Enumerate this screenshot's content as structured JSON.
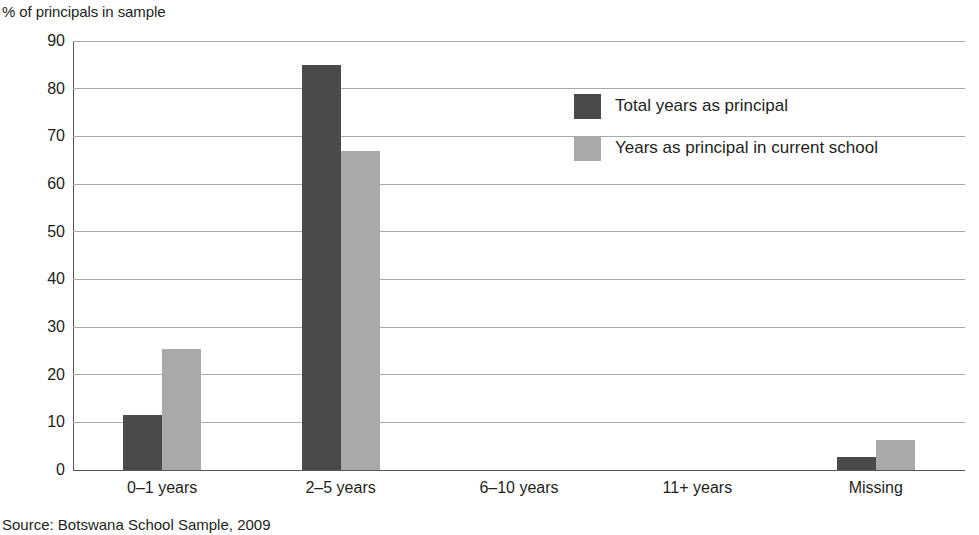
{
  "chart_data": {
    "type": "bar",
    "title": "",
    "subtitle": "% of principals in sample",
    "xlabel": "",
    "ylabel": "% of principals in sample",
    "categories": [
      "0–1 years",
      "2–5 years",
      "6–10 years",
      "11+ years",
      "Missing"
    ],
    "series": [
      {
        "name": "Total years as principal",
        "color": "#4a4a4a",
        "values": [
          11.5,
          85.0,
          0.0,
          0.0,
          2.7
        ]
      },
      {
        "name": "Years as principal in current school",
        "color": "#a9a9a9",
        "values": [
          25.3,
          67.0,
          0.0,
          0.0,
          6.4
        ]
      }
    ],
    "ylim": [
      0,
      90
    ],
    "yticks": [
      0,
      10,
      20,
      30,
      40,
      50,
      60,
      70,
      80,
      90
    ],
    "ytick_labels": [
      "0",
      "10",
      "20",
      "30",
      "40",
      "50",
      "60",
      "70",
      "80",
      "90"
    ],
    "grid": "horizontal",
    "legend_position": "inside-upper-center"
  },
  "legend": {
    "items": [
      {
        "label": "Total years as principal",
        "color": "#4a4a4a"
      },
      {
        "label": "Years as principal in current school",
        "color": "#a9a9a9"
      }
    ]
  },
  "source": {
    "note": "Source: Botswana School Sample, 2009"
  },
  "colors": {
    "series_dark": "#4a4a4a",
    "series_light": "#a9a9a9",
    "gridline": "#a7a9ac",
    "axis": "#58595b",
    "text": "#231f20"
  }
}
